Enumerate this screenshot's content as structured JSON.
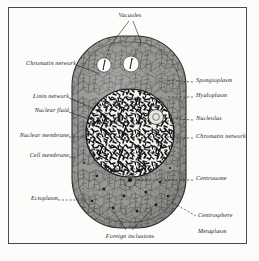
{
  "figure": {
    "kind": "labelled biological illustration",
    "frame_color": "#4a4a4a",
    "paper_color": "#fbfbfa",
    "ink_color": "#20201e",
    "cytoplasm_color": "#9a9a98",
    "nucleus_color": "#f2f2ef",
    "chromatin_color": "#1a1a1a"
  },
  "labels": {
    "vacuoles": "Vacuoles",
    "chromatin_network_left": "Chromatin network",
    "linin_network": "Linin network",
    "nuclear_fluid": "Nuclear fluid",
    "nuclear_membrane": "Nuclear membrane",
    "cell_membrane": "Cell membrane",
    "ectoplasm": "Ectoplasm",
    "spongioplasm": "Spongioplasm",
    "hyaloplasm": "Hyaloplasm",
    "nucleolus": "Nucleolus",
    "chromatin_network_right": "Chromatin network",
    "centrosome": "Centrosome",
    "centrosphere": "Centrosphere",
    "metaplasm": "Metaplasm",
    "foreign_inclusions": "Foreign inclusions"
  },
  "structures": [
    {
      "name": "cell-membrane",
      "shape": "rounded-oval",
      "cx": 129,
      "cy": 132,
      "rx": 57,
      "ry": 96
    },
    {
      "name": "ectoplasm-ring",
      "shape": "rounded-oval-inner",
      "cx": 129,
      "cy": 132,
      "rx": 51,
      "ry": 90
    },
    {
      "name": "nucleus",
      "shape": "circle",
      "cx": 130,
      "cy": 133,
      "r": 44
    },
    {
      "name": "nucleolus",
      "shape": "circle",
      "cx": 156,
      "cy": 117,
      "r": 7
    },
    {
      "name": "vacuole-left",
      "shape": "circle",
      "cx": 104,
      "cy": 65,
      "r": 7
    },
    {
      "name": "vacuole-right",
      "shape": "circle",
      "cx": 131,
      "cy": 64,
      "r": 8
    },
    {
      "name": "centrosome",
      "shape": "dot",
      "cx": 130,
      "cy": 181,
      "r": 2
    }
  ]
}
